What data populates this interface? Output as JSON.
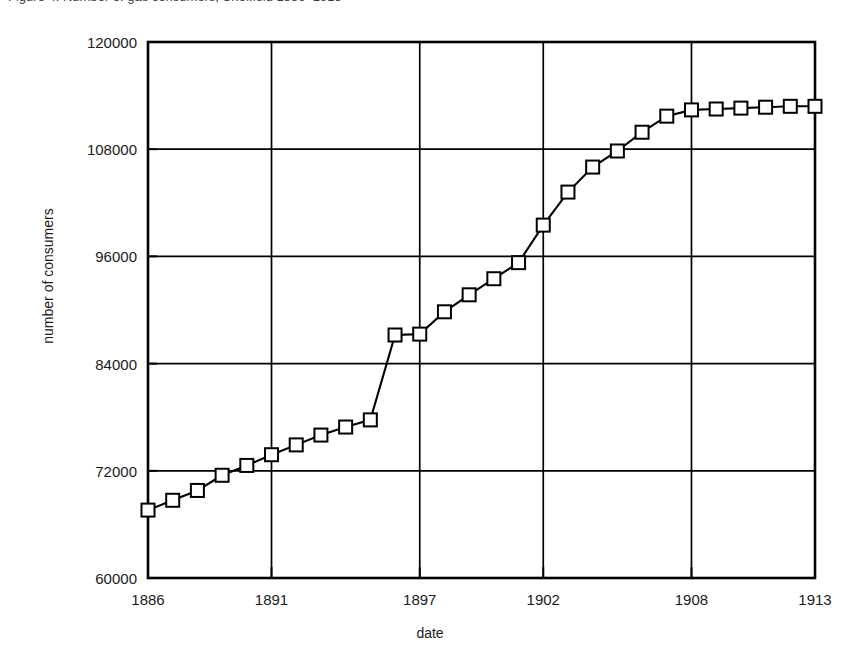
{
  "caption": {
    "text": "Figure 4.  Number of gas consumers, Sheffield 1886–1913"
  },
  "chart_data": {
    "type": "line",
    "title": "",
    "xlabel": "date",
    "ylabel": "number of consumers",
    "xlim": [
      1886,
      1913
    ],
    "ylim": [
      60000,
      120000
    ],
    "xticks": [
      1886,
      1891,
      1897,
      1902,
      1908,
      1913
    ],
    "xticklabels": [
      "1886",
      "1891",
      "1897",
      "1902",
      "1908",
      "1913"
    ],
    "yticks": [
      60000,
      72000,
      84000,
      96000,
      108000,
      120000
    ],
    "yticklabels": [
      "60000",
      "72000",
      "84000",
      "96000",
      "108000",
      "120000"
    ],
    "grid": true,
    "legend": false,
    "marker": "square-open",
    "x": [
      1886,
      1887,
      1888,
      1889,
      1890,
      1891,
      1892,
      1893,
      1894,
      1895,
      1896,
      1897,
      1898,
      1899,
      1900,
      1901,
      1902,
      1903,
      1904,
      1905,
      1906,
      1907,
      1908,
      1909,
      1910,
      1911,
      1912,
      1913
    ],
    "values": [
      67600,
      68700,
      69800,
      71500,
      72600,
      73800,
      74900,
      76000,
      76900,
      77700,
      87200,
      87300,
      89800,
      91700,
      93500,
      95300,
      99500,
      103200,
      106000,
      107800,
      109900,
      111700,
      112400,
      112500,
      112600,
      112700,
      112800,
      112800
    ],
    "series": [
      {
        "name": "number of consumers",
        "values": [
          67600,
          68700,
          69800,
          71500,
          72600,
          73800,
          74900,
          76000,
          76900,
          77700,
          87200,
          87300,
          89800,
          91700,
          93500,
          95300,
          99500,
          103200,
          106000,
          107800,
          109900,
          111700,
          112400,
          112500,
          112600,
          112700,
          112800,
          112800
        ]
      }
    ],
    "annotations": [
      "Sharp discontinuity between 1895 and 1896 (step from about 77700 to about 87200)."
    ],
    "colors": {
      "line": "#000000",
      "marker_fill": "#ffffff",
      "marker_stroke": "#000000",
      "grid": "#000000",
      "background": "#ffffff"
    }
  }
}
